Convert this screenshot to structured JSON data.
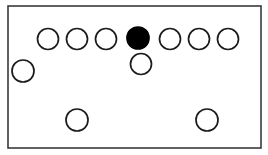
{
  "figure": {
    "canvas": {
      "width": 268,
      "height": 155,
      "background": "#ffffff"
    },
    "frame": {
      "name": "bounding-rectangle",
      "x": 8,
      "y": 6,
      "width": 253,
      "height": 142,
      "stroke": "#3a3a3a",
      "stroke_width": 1.6,
      "fill": "#ffffff"
    },
    "styles": {
      "outline_stroke": "#1c1c1c",
      "outline_fill": "#ffffff",
      "filled_fill": "#000000",
      "stroke_width": 1.7
    },
    "counts": {
      "total_circles": 11,
      "filled_circles": 1,
      "outlined_circles": 10,
      "top_row_circles": 7,
      "bottom_row_circles": 2
    },
    "circles": [
      {
        "id": "top-1",
        "label": "top-row-circle-1",
        "cx": 48,
        "cy": 39,
        "r": 10.5,
        "fill": "outline",
        "group": "top-row"
      },
      {
        "id": "top-2",
        "label": "top-row-circle-2",
        "cx": 77,
        "cy": 39,
        "r": 10.5,
        "fill": "outline",
        "group": "top-row"
      },
      {
        "id": "top-3",
        "label": "top-row-circle-3",
        "cx": 106,
        "cy": 39,
        "r": 10.5,
        "fill": "outline",
        "group": "top-row"
      },
      {
        "id": "top-4",
        "label": "top-row-circle-4-filled",
        "cx": 138,
        "cy": 38,
        "r": 11.0,
        "fill": "solid",
        "group": "top-row"
      },
      {
        "id": "top-5",
        "label": "top-row-circle-5",
        "cx": 170,
        "cy": 39,
        "r": 10.5,
        "fill": "outline",
        "group": "top-row"
      },
      {
        "id": "top-6",
        "label": "top-row-circle-6",
        "cx": 199,
        "cy": 39,
        "r": 10.5,
        "fill": "outline",
        "group": "top-row"
      },
      {
        "id": "top-7",
        "label": "top-row-circle-7",
        "cx": 228,
        "cy": 39,
        "r": 10.5,
        "fill": "outline",
        "group": "top-row"
      },
      {
        "id": "mid-center",
        "label": "center-circle-below-filled",
        "cx": 141,
        "cy": 64,
        "r": 10.5,
        "fill": "outline",
        "group": "middle-row"
      },
      {
        "id": "mid-left",
        "label": "left-edge-circle",
        "cx": 23,
        "cy": 71,
        "r": 11.0,
        "fill": "outline",
        "group": "middle-row"
      },
      {
        "id": "bottom-left",
        "label": "bottom-row-circle-left",
        "cx": 77,
        "cy": 120,
        "r": 11.0,
        "fill": "outline",
        "group": "bottom-row"
      },
      {
        "id": "bottom-right",
        "label": "bottom-row-circle-right",
        "cx": 207,
        "cy": 120,
        "r": 11.0,
        "fill": "outline",
        "group": "bottom-row"
      }
    ]
  }
}
